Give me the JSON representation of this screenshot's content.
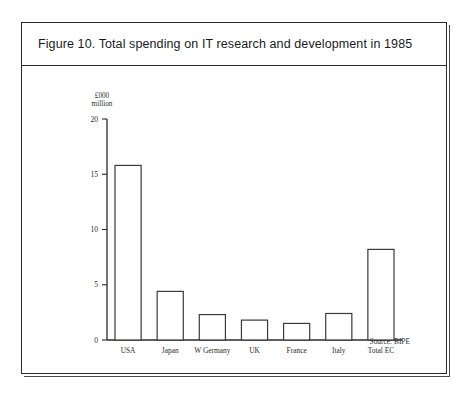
{
  "figure": {
    "title": "Figure 10. Total spending on IT research and development in 1985",
    "source_note": "Source: BIPE",
    "unit_caption": "£000\nmillion"
  },
  "chart_data": {
    "type": "bar",
    "title": "Figure 10. Total spending on IT research and development in 1985",
    "xlabel": "",
    "ylabel": "£000 million",
    "ylim": [
      0,
      20
    ],
    "yticks": [
      0,
      5,
      10,
      15,
      20
    ],
    "ytick_labels": [
      "0",
      "5",
      "10",
      "15",
      "20"
    ],
    "grid": false,
    "legend": "none",
    "categories": [
      "USA",
      "Japan",
      "W Germany",
      "UK",
      "France",
      "Italy",
      "Total EC"
    ],
    "values": [
      15.8,
      4.4,
      2.3,
      1.8,
      1.5,
      2.4,
      8.2
    ],
    "annotations": [
      "Source: BIPE"
    ]
  },
  "colors": {
    "frame": "#2b2b2b",
    "bar_stroke": "#3a3a3a",
    "bar_fill": "#ffffff",
    "text": "#1a1a1a",
    "page_background": "#ffffff"
  }
}
